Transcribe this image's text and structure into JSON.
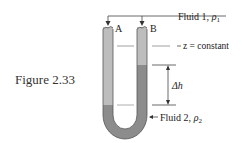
{
  "figure": {
    "caption": "Figure 2.33",
    "labels": {
      "fluid1": "Fluid 1,",
      "fluid1_rho": "ρ",
      "fluid1_sub": "1",
      "fluid2": "Fluid 2,",
      "fluid2_rho": "ρ",
      "fluid2_sub": "2",
      "z_const": "z = constant",
      "delta_h": "Δh",
      "tube_a": "A",
      "tube_b": "B"
    },
    "colors": {
      "fluid1": "#b9b9b9",
      "fluid2": "#8a8a8a",
      "outline": "#333333",
      "lines": "#444444"
    }
  }
}
